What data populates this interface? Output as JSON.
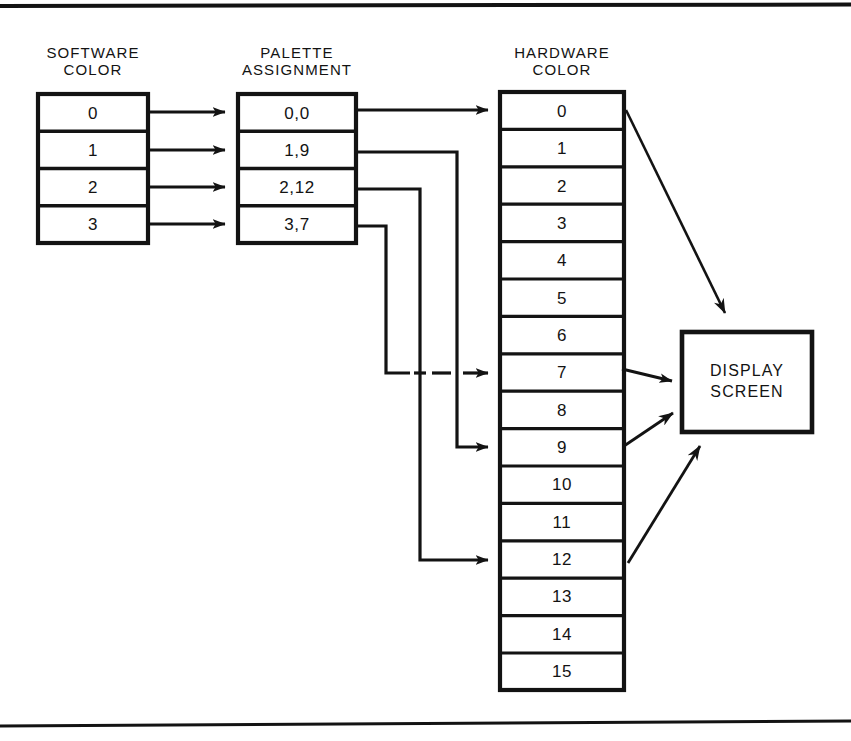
{
  "figure": {
    "kind": "block-diagram",
    "ink_color": "#131313",
    "paper_color": "#ffffff",
    "rules": {
      "top_rule": true,
      "bottom_rule": true
    }
  },
  "columns": {
    "software": {
      "title": "SOFTWARE\nCOLOR",
      "cells": [
        "0",
        "1",
        "2",
        "3"
      ]
    },
    "palette": {
      "title": "PALETTE\nASSIGNMENT",
      "cells": [
        "0,0",
        "1,9",
        "2,12",
        "3,7"
      ]
    },
    "hardware": {
      "title": "HARDWARE\nCOLOR",
      "cells": [
        "0",
        "1",
        "2",
        "3",
        "4",
        "5",
        "6",
        "7",
        "8",
        "9",
        "10",
        "11",
        "12",
        "13",
        "14",
        "15"
      ]
    }
  },
  "display": {
    "label": "DISPLAY\nSCREEN"
  },
  "connections": {
    "software_to_palette": [
      {
        "from": "software.0",
        "to": "palette.0"
      },
      {
        "from": "software.1",
        "to": "palette.1"
      },
      {
        "from": "software.2",
        "to": "palette.2"
      },
      {
        "from": "software.3",
        "to": "palette.3"
      }
    ],
    "palette_to_hardware": [
      {
        "from": "palette.0",
        "to": "hardware.0",
        "route": "straight"
      },
      {
        "from": "palette.1",
        "to": "hardware.9",
        "route": "orthogonal"
      },
      {
        "from": "palette.2",
        "to": "hardware.12",
        "route": "orthogonal"
      },
      {
        "from": "palette.3",
        "to": "hardware.7",
        "route": "orthogonal-dashed-crossing"
      }
    ],
    "hardware_to_display": [
      {
        "from": "hardware.0",
        "to": "display"
      },
      {
        "from": "hardware.7",
        "to": "display"
      },
      {
        "from": "hardware.9",
        "to": "display"
      },
      {
        "from": "hardware.12",
        "to": "display"
      }
    ]
  }
}
